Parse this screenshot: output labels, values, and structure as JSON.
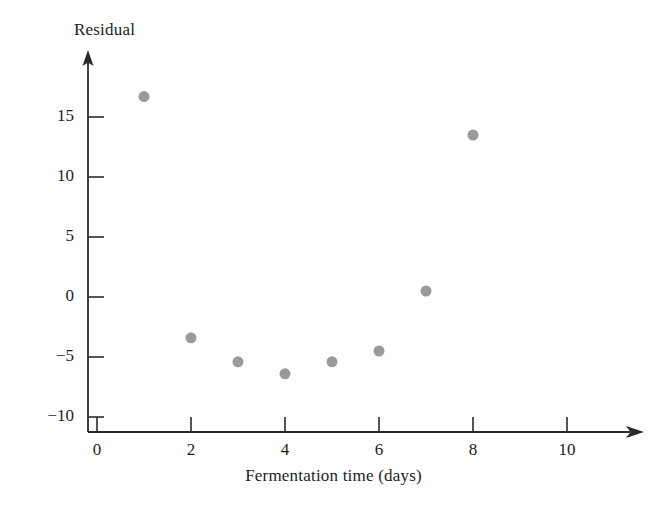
{
  "chart_data": {
    "type": "scatter",
    "title": "",
    "xlabel": "Fermentation time (days)",
    "ylabel": "Residual",
    "xlim": [
      0,
      11.5
    ],
    "ylim": [
      -10,
      19
    ],
    "grid": false,
    "legend": "none",
    "xticks": [
      0,
      2,
      4,
      6,
      8,
      10
    ],
    "xtick_labels": [
      "0",
      "2",
      "4",
      "6",
      "8",
      "10"
    ],
    "yticks": [
      15,
      10,
      5,
      0,
      -5,
      -10
    ],
    "ytick_labels": [
      "15",
      "10",
      "5",
      "0",
      "−5",
      "−10"
    ],
    "marker_color": "#9a9a9a",
    "marker_size": 11,
    "axis_color": "#2a2a2a",
    "x": [
      1,
      2,
      3,
      4,
      5,
      6,
      7,
      8
    ],
    "y": [
      16.7,
      -3.4,
      -5.4,
      -6.4,
      -5.4,
      -4.5,
      0.5,
      13.5
    ],
    "points": [
      {
        "x": 1,
        "y": 16.7
      },
      {
        "x": 2,
        "y": -3.4
      },
      {
        "x": 3,
        "y": -5.4
      },
      {
        "x": 4,
        "y": -6.4
      },
      {
        "x": 5,
        "y": -5.4
      },
      {
        "x": 6,
        "y": -4.5
      },
      {
        "x": 7,
        "y": 0.5
      },
      {
        "x": 8,
        "y": 13.5
      }
    ]
  },
  "axes": {
    "x_arrow": true,
    "y_arrow": true
  }
}
